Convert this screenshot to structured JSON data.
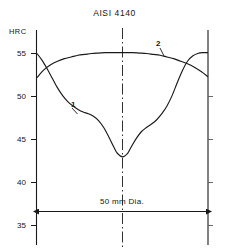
{
  "chart_data": {
    "type": "line",
    "title": "AISI 4140",
    "ylabel": "HRC",
    "xlabel": "50 mm Dia.",
    "ylim": [
      33.5,
      56.5
    ],
    "yticks": [
      55,
      50,
      45,
      40,
      35
    ],
    "ytick_labels": [
      "55",
      "50",
      "45",
      "40",
      "35"
    ],
    "xlim": [
      -25,
      25
    ],
    "grid": false,
    "legend": "inline-curve-labels",
    "annotations": [
      {
        "text": "1",
        "x": -10.5,
        "y": 49.6,
        "note": "label for curve 1 with leader line"
      },
      {
        "text": "2",
        "x": 11.5,
        "y": 55.9,
        "note": "label for curve 2 with leader line"
      },
      {
        "text": "50 mm Dia.",
        "x": 0,
        "y": 37.8,
        "note": "dimension line with double arrow across full diameter"
      }
    ],
    "series": [
      {
        "name": "1",
        "label": "1",
        "color": "#1a1a1a",
        "x": [
          -25,
          -23.5,
          -22,
          -20.5,
          -19,
          -17.5,
          -16,
          -14.5,
          -13,
          -11.5,
          -10,
          -8.5,
          -7,
          -5.5,
          -4,
          -2.5,
          -1.5,
          0,
          1.5,
          2.5,
          4,
          5.5,
          7,
          8.5,
          10,
          11.5,
          13,
          14.5,
          16,
          17.5,
          19,
          20.5,
          22,
          23.5,
          25
        ],
        "y": [
          55.0,
          54.2,
          53.2,
          52.1,
          51.0,
          50.1,
          49.4,
          48.9,
          48.5,
          48.2,
          48.0,
          47.7,
          47.2,
          46.4,
          45.3,
          44.1,
          43.4,
          43.0,
          43.4,
          44.1,
          45.1,
          45.9,
          46.4,
          46.8,
          47.3,
          48.0,
          48.9,
          50.1,
          51.6,
          53.0,
          54.1,
          54.7,
          55.0,
          55.1,
          55.1
        ]
      },
      {
        "name": "2",
        "label": "2",
        "color": "#1a1a1a",
        "x": [
          -25,
          -23,
          -21,
          -19,
          -17,
          -15,
          -13,
          -11,
          -9,
          -7,
          -5,
          -3,
          -1,
          0,
          1,
          3,
          5,
          7,
          9,
          11,
          13,
          15,
          17,
          19,
          21,
          23,
          25
        ],
        "y": [
          52.2,
          53.1,
          53.7,
          54.1,
          54.4,
          54.6,
          54.8,
          54.9,
          55.0,
          55.05,
          55.1,
          55.1,
          55.1,
          55.1,
          55.1,
          55.1,
          55.05,
          55.0,
          54.9,
          54.8,
          54.6,
          54.4,
          54.1,
          53.8,
          53.4,
          52.9,
          52.3
        ]
      }
    ]
  },
  "axis": {
    "y_axis_name": "HRC",
    "tick_55": "55",
    "tick_50": "50",
    "tick_45": "45",
    "tick_40": "40",
    "tick_35": "35"
  },
  "labels": {
    "curve_one": "1",
    "curve_two": "2",
    "dimension": "50 mm Dia."
  },
  "colors": {
    "ink": "#1a1a1a",
    "background": "#ffffff"
  }
}
